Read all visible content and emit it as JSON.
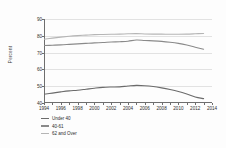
{
  "chart_data": {
    "type": "line",
    "title": "",
    "xlabel": "",
    "ylabel": "Percent",
    "ylim": [
      40,
      90
    ],
    "xlim": [
      1994,
      2014
    ],
    "yticks": [
      90,
      80,
      70,
      60,
      50,
      40
    ],
    "xticks": [
      1994,
      1996,
      1998,
      2000,
      2002,
      2004,
      2006,
      2008,
      2010,
      2012,
      2014
    ],
    "grid": true,
    "legend_position": "below-left",
    "x": [
      1994,
      1995,
      1996,
      1997,
      1998,
      1999,
      2000,
      2001,
      2002,
      2003,
      2004,
      2005,
      2006,
      2007,
      2008,
      2009,
      2010,
      2011,
      2012,
      2013
    ],
    "series": [
      {
        "name": "Under 40",
        "color": "#6b6b6b",
        "values": [
          45.2,
          45.9,
          46.6,
          47.2,
          47.6,
          48.2,
          48.8,
          49.3,
          49.5,
          49.6,
          50.1,
          50.5,
          50.3,
          49.8,
          49.0,
          48.0,
          46.8,
          45.3,
          43.6,
          42.6
        ]
      },
      {
        "name": "40-61",
        "color": "#8a8a8a",
        "values": [
          74.2,
          74.4,
          74.6,
          74.9,
          75.2,
          75.5,
          75.8,
          76.0,
          76.3,
          76.5,
          76.8,
          77.5,
          77.2,
          77.0,
          76.7,
          76.2,
          75.5,
          74.5,
          73.2,
          72.0
        ]
      },
      {
        "name": "62 and Over",
        "color": "#b5b5b5",
        "values": [
          77.9,
          78.6,
          79.2,
          79.7,
          80.1,
          80.4,
          80.7,
          80.8,
          80.9,
          81.0,
          81.2,
          81.3,
          81.1,
          81.0,
          81.0,
          80.9,
          80.9,
          81.0,
          81.2,
          81.4
        ]
      }
    ]
  },
  "legend": {
    "items": [
      {
        "label": "Under 40"
      },
      {
        "label": "40-61"
      },
      {
        "label": "62 and Over"
      }
    ]
  },
  "axes": {
    "y_title": "Percent"
  }
}
